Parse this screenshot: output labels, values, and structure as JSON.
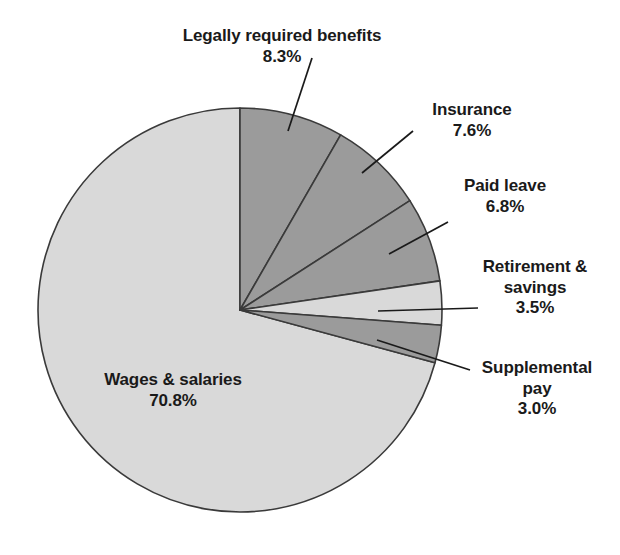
{
  "chart_data": {
    "type": "pie",
    "title": "",
    "subtitle": "",
    "xlabel": "",
    "ylabel": "",
    "legend_position": "none",
    "grid": false,
    "units": "percent",
    "start_angle_deg": 0,
    "direction": "clockwise",
    "categories": [
      "Legally required benefits",
      "Insurance",
      "Paid leave",
      "Retirement & savings",
      "Supplemental pay",
      "Wages & salaries"
    ],
    "values": [
      8.3,
      7.6,
      6.8,
      3.5,
      3.0,
      70.8
    ],
    "slices": [
      {
        "label": "Legally required benefits",
        "value_text": "8.3%",
        "value": 8.3,
        "color": "#9b9b9b",
        "label_lines": [
          "Legally required benefits",
          "8.3%"
        ]
      },
      {
        "label": "Insurance",
        "value_text": "7.6%",
        "value": 7.6,
        "color": "#9b9b9b",
        "label_lines": [
          "Insurance",
          "7.6%"
        ]
      },
      {
        "label": "Paid leave",
        "value_text": "6.8%",
        "value": 6.8,
        "color": "#9b9b9b",
        "label_lines": [
          "Paid leave",
          "6.8%"
        ]
      },
      {
        "label": "Retirement & savings",
        "value_text": "3.5%",
        "value": 3.5,
        "color": "#d9d9d9",
        "label_lines": [
          "Retirement &",
          "savings",
          "3.5%"
        ]
      },
      {
        "label": "Supplemental pay",
        "value_text": "3.0%",
        "value": 3.0,
        "color": "#9b9b9b",
        "label_lines": [
          "Supplemental",
          "pay",
          "3.0%"
        ]
      },
      {
        "label": "Wages & salaries",
        "value_text": "70.8%",
        "value": 70.8,
        "color": "#d9d9d9",
        "label_lines": [
          "Wages & salaries",
          "70.8%"
        ]
      }
    ],
    "colors": {
      "dark_slice": "#9b9b9b",
      "light_slice": "#d9d9d9",
      "outline": "#3a3a3a",
      "text": "#1a1a1a",
      "background": "#ffffff"
    }
  },
  "labels": {
    "legally_required_benefits": {
      "name": "Legally required benefits",
      "percent": "8.3%"
    },
    "insurance": {
      "name": "Insurance",
      "percent": "7.6%"
    },
    "paid_leave": {
      "name": "Paid leave",
      "percent": "6.8%"
    },
    "retirement_savings": {
      "name_line1": "Retirement &",
      "name_line2": "savings",
      "percent": "3.5%"
    },
    "supplemental_pay": {
      "name_line1": "Supplemental",
      "name_line2": "pay",
      "percent": "3.0%"
    },
    "wages_salaries": {
      "name": "Wages & salaries",
      "percent": "70.8%"
    }
  }
}
